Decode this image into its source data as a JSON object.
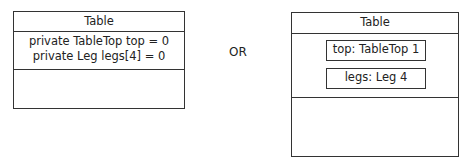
{
  "left": {
    "title": "Table",
    "attributes": [
      "private TableTop top = 0",
      "private Leg legs[4] = 0"
    ]
  },
  "separator": "OR",
  "right": {
    "title": "Table",
    "parts": [
      "top: TableTop 1",
      "legs: Leg 4"
    ]
  }
}
